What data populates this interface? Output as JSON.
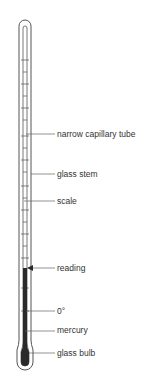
{
  "diagram": {
    "colors": {
      "outline": "#555555",
      "mercury": "#2a2a2a",
      "leader": "#666666",
      "text": "#333333"
    },
    "labels": [
      {
        "id": "narrow-capillary-tube",
        "text": "narrow capillary tube",
        "y": 130,
        "target_x": 26
      },
      {
        "id": "glass-stem",
        "text": "glass stem",
        "y": 170,
        "target_x": 30
      },
      {
        "id": "scale",
        "text": "scale",
        "y": 197,
        "target_x": 24
      },
      {
        "id": "reading",
        "text": "reading",
        "y": 268,
        "target_x": 28
      },
      {
        "id": "zero-degree",
        "text": "0°",
        "y": 311,
        "target_x": 26
      },
      {
        "id": "mercury",
        "text": "mercury",
        "y": 329,
        "target_x": 25
      },
      {
        "id": "glass-bulb",
        "text": "glass bulb",
        "y": 352,
        "target_x": 29
      }
    ]
  }
}
